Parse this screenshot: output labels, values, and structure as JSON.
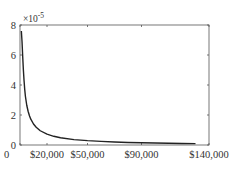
{
  "chart_data": {
    "type": "line",
    "title": "",
    "xlabel": "",
    "ylabel": "",
    "y_multiplier_label": "×10",
    "y_multiplier_exponent": "-5",
    "xlim": [
      0,
      140000
    ],
    "ylim": [
      0,
      8
    ],
    "grid": false,
    "x_ticks": [
      {
        "value": 0,
        "label": "0"
      },
      {
        "value": 20000,
        "label": "$20,000"
      },
      {
        "value": 50000,
        "label": "$50,000"
      },
      {
        "value": 90000,
        "label": "$90,000"
      },
      {
        "value": 140000,
        "label": "$140,000"
      }
    ],
    "y_ticks": [
      {
        "value": 0,
        "label": "0"
      },
      {
        "value": 2,
        "label": "2"
      },
      {
        "value": 4,
        "label": "4"
      },
      {
        "value": 6,
        "label": "6"
      },
      {
        "value": 8,
        "label": "8"
      }
    ],
    "series": [
      {
        "name": "density",
        "color": "#222222",
        "x": [
          1000,
          1500,
          2000,
          2500,
          3000,
          3500,
          4000,
          5000,
          6000,
          7000,
          8000,
          10000,
          12000,
          15000,
          20000,
          25000,
          30000,
          40000,
          50000,
          60000,
          70000,
          80000,
          90000,
          100000,
          110000,
          120000,
          130000
        ],
        "y": [
          7.6,
          6.9,
          5.9,
          5.0,
          4.3,
          3.7,
          3.25,
          2.65,
          2.25,
          1.95,
          1.72,
          1.4,
          1.18,
          0.95,
          0.72,
          0.58,
          0.48,
          0.36,
          0.29,
          0.24,
          0.2,
          0.17,
          0.15,
          0.13,
          0.115,
          0.1,
          0.09
        ]
      }
    ]
  }
}
